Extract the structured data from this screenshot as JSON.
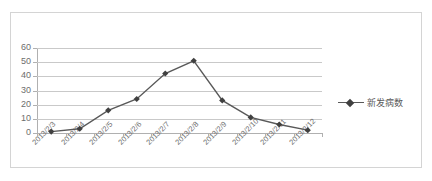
{
  "chart_data": {
    "type": "line",
    "title": "",
    "xlabel": "",
    "ylabel": "",
    "categories": [
      "2013/2/3",
      "2013/2/4",
      "2013/2/5",
      "2013/2/6",
      "2013/2/7",
      "2013/2/8",
      "2013/2/9",
      "2013/2/10",
      "2013/2/11",
      "2013/2/12"
    ],
    "series": [
      {
        "name": "新发病数",
        "values": [
          1,
          3,
          16,
          24,
          42,
          51,
          23,
          11,
          6,
          2
        ],
        "color": "#595959",
        "marker": "diamond"
      }
    ],
    "ylim": [
      0,
      60
    ],
    "yticks": [
      0,
      10,
      20,
      30,
      40,
      50,
      60
    ],
    "ytick_labels": [
      "0",
      "10",
      "20",
      "30",
      "40",
      "50",
      "60"
    ],
    "grid": true,
    "grid_axis": "y",
    "legend_position": "right",
    "x_tick_label_rotation": -45
  },
  "legend": {
    "entries": [
      {
        "label": "新发病数"
      }
    ]
  },
  "colors": {
    "series_line": "#595959",
    "marker_fill": "#404040",
    "gridline": "#c9c9c9",
    "axis_line": "#b0b0b0",
    "tick_text": "#6d6d6d",
    "frame_border": "#d4d4d4",
    "background": "#ffffff"
  }
}
